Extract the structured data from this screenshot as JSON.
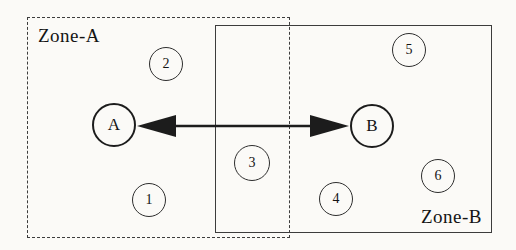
{
  "diagram": {
    "zones": [
      {
        "id": "zone-a",
        "label": "Zone-A",
        "border_style": "dashed"
      },
      {
        "id": "zone-b",
        "label": "Zone-B",
        "border_style": "solid"
      }
    ],
    "nodes": [
      {
        "id": "A",
        "label": "A",
        "type": "major",
        "zone": "Zone-A"
      },
      {
        "id": "B",
        "label": "B",
        "type": "major",
        "zone": "Zone-B"
      },
      {
        "id": "1",
        "label": "1",
        "type": "minor",
        "zone": "Zone-A"
      },
      {
        "id": "2",
        "label": "2",
        "type": "minor",
        "zone": "Zone-A"
      },
      {
        "id": "3",
        "label": "3",
        "type": "minor",
        "zone": "overlap"
      },
      {
        "id": "4",
        "label": "4",
        "type": "minor",
        "zone": "Zone-B"
      },
      {
        "id": "5",
        "label": "5",
        "type": "minor",
        "zone": "Zone-B"
      },
      {
        "id": "6",
        "label": "6",
        "type": "minor",
        "zone": "Zone-B"
      }
    ],
    "edges": [
      {
        "from": "A",
        "to": "B",
        "style": "double-headed-arrow"
      }
    ],
    "colors": {
      "line": "#1c1c1c",
      "background": "#fbfaf7"
    }
  }
}
